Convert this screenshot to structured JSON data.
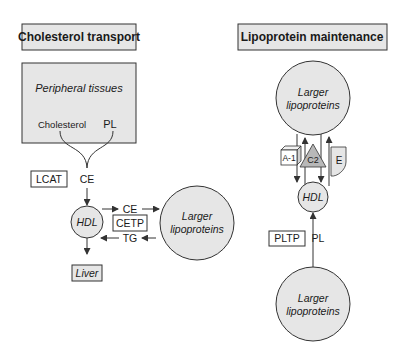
{
  "left_panel": {
    "title": "Cholesterol transport",
    "peripheral_box": {
      "title": "Peripheral tissues",
      "cholesterol": "Cholesterol",
      "pl": "PL"
    },
    "lcat": "LCAT",
    "ce_top": "CE",
    "hdl": "HDL",
    "ce_right": "CE",
    "cetp": "CETP",
    "tg": "TG",
    "liver": "Liver",
    "larger_lipoproteins_1": "Larger",
    "larger_lipoproteins_2": "lipoproteins"
  },
  "right_panel": {
    "title": "Lipoprotein maintenance",
    "top_circle_1": "Larger",
    "top_circle_2": "lipoproteins",
    "apo_a1": "A-1",
    "apo_c2": "C2",
    "apo_e": "E",
    "hdl": "HDL",
    "pltp": "PLTP",
    "pl": "PL",
    "bottom_circle_1": "Larger",
    "bottom_circle_2": "lipoproteins"
  },
  "colors": {
    "fill_gray": "#e6e6e6",
    "triangle_gray": "#b8b8b8",
    "stroke": "#333333"
  }
}
